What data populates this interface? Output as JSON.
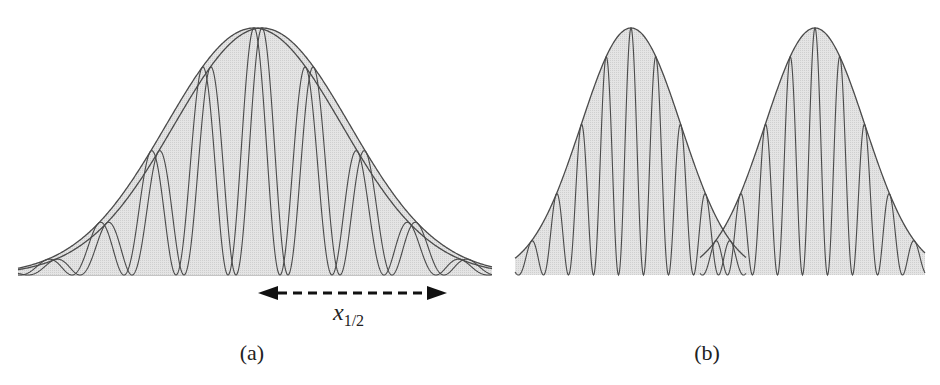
{
  "figure": {
    "background": "#ffffff",
    "fill_color": "#dcdcdc",
    "stroke_color": "#4a4a4a",
    "baseline_y": 275,
    "peak_y": 28
  },
  "panels": [
    {
      "id": "a",
      "label": "(a)",
      "label_pos": [
        252,
        360
      ],
      "description": "Gaussian envelope with interference fringes from two slightly shifted copies",
      "envelope_center_x": 258,
      "envelope_sigma_px": 88,
      "envelope_offsets_px": [
        -4,
        4
      ],
      "fringe_period_px": 52,
      "x_range": [
        18,
        492
      ],
      "annotation": {
        "arrow_label_main": "x",
        "arrow_label_sub": "1/2",
        "arrow_from_x": 258,
        "arrow_to_x": 447,
        "arrow_y": 293,
        "arrow_style": "dashed-double-headed"
      }
    },
    {
      "id": "b",
      "label": "(b)",
      "label_pos": [
        707,
        360
      ],
      "description": "Two separated Gaussian wave packets with fringes",
      "packets": [
        {
          "center_x": 631,
          "sigma_px": 50
        },
        {
          "center_x": 815,
          "sigma_px": 50
        }
      ],
      "fringe_period_px": 25,
      "x_range": [
        515,
        925
      ]
    }
  ]
}
